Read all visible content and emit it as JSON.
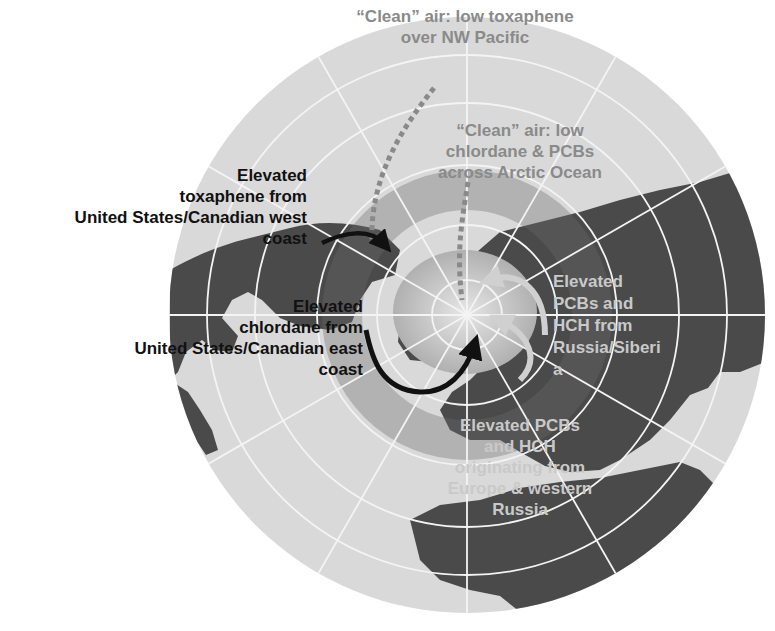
{
  "figure": {
    "projection": "north-polar azimuthal",
    "colors": {
      "background": "#ffffff",
      "ocean": "#d9d9d9",
      "land": "#4a4a4a",
      "land_shaded_band": "#6a6a6a",
      "arctic_ice": "#bdbdbd",
      "graticule": "#f4f4f4",
      "arrow_dark": "#111111",
      "arrow_dotted": "#8a8a8a",
      "arrow_light": "#cfcfcf",
      "label_dark": "#111111",
      "label_grey": "#8a8a8a",
      "label_light": "#c9c9c9"
    }
  },
  "labels": {
    "clean_pacific": {
      "line1": "“Clean” air: low toxaphene",
      "line2": "over NW Pacific"
    },
    "clean_arctic": {
      "line1": "“Clean” air: low",
      "line2": "chlordane & PCBs",
      "line3": "across Arctic Ocean"
    },
    "toxaphene_west": {
      "line1": "Elevated",
      "line2": "toxaphene  from",
      "line3": "United States/Canadian west",
      "line4": "coast"
    },
    "chlordane_east": {
      "line1": "Elevated",
      "line2": "chlordane from",
      "line3": "United States/Canadian east",
      "line4": "coast"
    },
    "pcbs_russia": {
      "line1": "Elevated",
      "line2": "PCBs and",
      "line3": "HCH from",
      "line4": "Russia/Siberi",
      "line5": "a"
    },
    "pcbs_europe": {
      "line1": "Elevated PCBs",
      "line2": "and HCH",
      "line3": "originating from",
      "line4": "Europe & western",
      "line5": "Russia"
    }
  },
  "arrows": [
    {
      "name": "toxaphene-west-arrow",
      "style": "solid-dark"
    },
    {
      "name": "chlordane-east-arrow",
      "style": "solid-dark"
    },
    {
      "name": "clean-pacific-arrow",
      "style": "dotted-grey"
    },
    {
      "name": "clean-arctic-arrow",
      "style": "dotted-grey"
    },
    {
      "name": "russia-europe-arrows",
      "style": "solid-light"
    }
  ]
}
